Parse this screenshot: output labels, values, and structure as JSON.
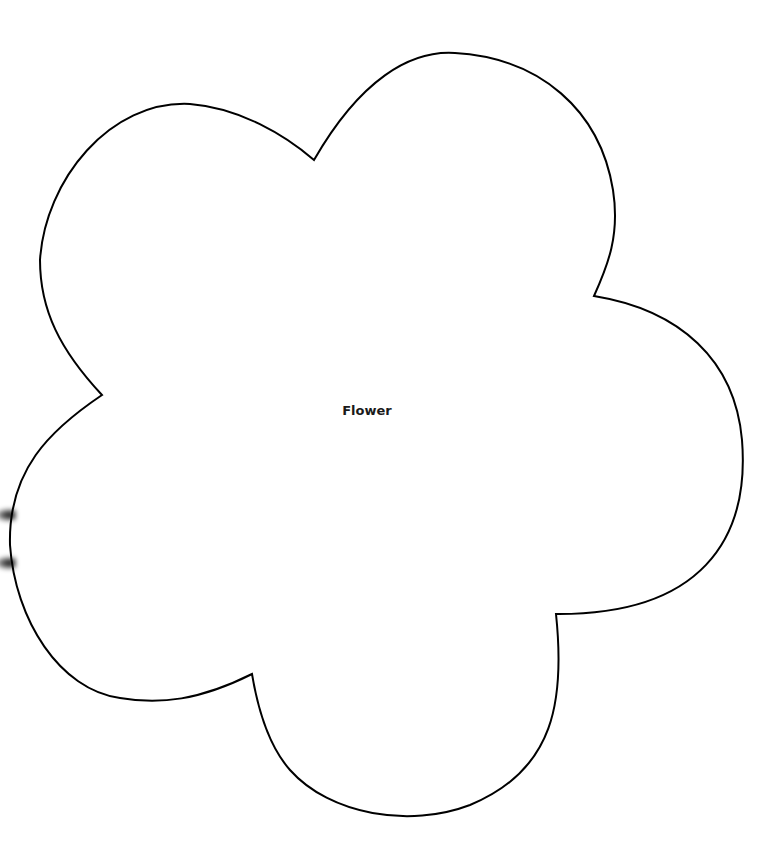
{
  "diagram": {
    "shape": {
      "type": "flower",
      "label": "Flower",
      "stroke_color": "#000000",
      "fill_color": "#ffffff",
      "petals": 5
    },
    "edge_marks": [
      {
        "y": 515
      },
      {
        "y": 563
      }
    ]
  }
}
